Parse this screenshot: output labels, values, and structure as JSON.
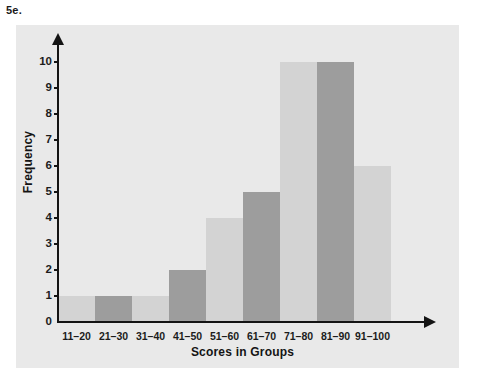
{
  "figure": {
    "problem_label": "5e."
  },
  "colors": {
    "panel_background": "#e9e9e9",
    "bar_light": "#d3d3d3",
    "bar_dark": "#9d9d9d",
    "axis": "#141414",
    "text": "#1c1c1c",
    "page_background": "#ffffff"
  },
  "chart_data": {
    "type": "bar",
    "title": "",
    "xlabel": "Scores in Groups",
    "ylabel": "Frequency",
    "categories": [
      "11–20",
      "21–30",
      "31–40",
      "41–50",
      "51–60",
      "61–70",
      "71–80",
      "81–90",
      "91–100"
    ],
    "values": [
      1,
      1,
      1,
      2,
      4,
      5,
      10,
      10,
      6
    ],
    "bar_shades": [
      "light",
      "dark",
      "light",
      "dark",
      "light",
      "dark",
      "light",
      "dark",
      "light"
    ],
    "ylim": [
      0,
      10
    ],
    "ytick_labels": [
      "10",
      "9",
      "8",
      "7",
      "6",
      "5",
      "4",
      "3",
      "2",
      "1",
      "0"
    ],
    "ytick_values": [
      10,
      9,
      8,
      7,
      6,
      5,
      4,
      3,
      2,
      1,
      0
    ],
    "grid": false,
    "legend": null,
    "axis_arrows": true
  }
}
